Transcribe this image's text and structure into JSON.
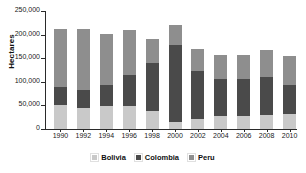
{
  "chart_data": {
    "type": "bar",
    "stacked": true,
    "title": "",
    "subtitle": "",
    "xlabel": "",
    "ylabel": "Hectares",
    "categories": [
      "1990",
      "1992",
      "1994",
      "1996",
      "1998",
      "2000",
      "2002",
      "2004",
      "2006",
      "2008",
      "2010"
    ],
    "ylim": [
      0,
      250000
    ],
    "yticks": [
      0,
      50000,
      100000,
      150000,
      200000,
      250000
    ],
    "ytick_labels": [
      "0",
      "50,000",
      "100,000",
      "150,000",
      "200,000",
      "250,000"
    ],
    "grid": false,
    "legend_position": "bottom",
    "series": [
      {
        "name": "Bolivia",
        "color": "#c9c9c9",
        "values": [
          50000,
          45000,
          48000,
          48000,
          38000,
          14000,
          21000,
          27000,
          27000,
          30000,
          31000
        ]
      },
      {
        "name": "Colombia",
        "color": "#4a4a4a",
        "values": [
          40000,
          37000,
          45000,
          67000,
          101000,
          163000,
          102000,
          80000,
          78000,
          81000,
          62000
        ]
      },
      {
        "name": "Peru",
        "color": "#8e8e8e",
        "values": [
          121000,
          129000,
          108000,
          94000,
          51000,
          43000,
          46000,
          50000,
          51000,
          56000,
          61000
        ]
      }
    ],
    "totals": [
      211000,
      211000,
      201000,
      209000,
      190000,
      220000,
      169000,
      157000,
      156000,
      167000,
      154000
    ],
    "legend": [
      "Bolivia",
      "Colombia",
      "Peru"
    ]
  },
  "axis": {
    "y_title": "Hectares"
  }
}
